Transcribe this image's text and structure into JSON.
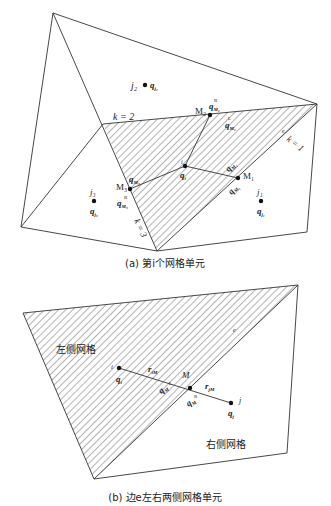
{
  "figure_a": {
    "caption": "(a) 第i个网格单元",
    "labels": {
      "j2": "j₂",
      "q_j2": "q",
      "q_j2_sub": "j₂",
      "k2": "k = 2",
      "k1": "k = 1",
      "k3": "k = 3",
      "e": "e",
      "M2": "M₂",
      "M1": "M₁",
      "M3": "M₃",
      "qR": "q",
      "sup_R": "R",
      "sup_L": "L",
      "subM1": "M₁",
      "subM2": "M₂",
      "subM3": "M₃",
      "i": "i",
      "q_i": "q",
      "q_i_sub": "i",
      "j1": "j₁",
      "q_j1": "q",
      "q_j1_sub": "j₁",
      "j3": "j₃",
      "q_j3": "q",
      "q_j3_sub": "j₃"
    }
  },
  "figure_b": {
    "caption": "(b) 边e左右两侧网格单元",
    "labels": {
      "left_cell": "左侧网格",
      "right_cell": "右侧网格",
      "e": "e",
      "i": "i",
      "j": "j",
      "M": "M",
      "q": "q",
      "sub_i": "i",
      "sub_j": "j",
      "sub_M": "M",
      "r_iM": "r",
      "r_iM_sub": "iM",
      "r_jM_sub": "jM",
      "sup_L": "L",
      "sup_R": "R"
    }
  },
  "colors": {
    "line": "#333333",
    "hatch": "#555555",
    "point": "#111111"
  }
}
